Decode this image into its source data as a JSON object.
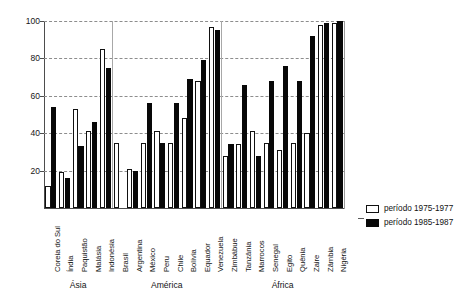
{
  "chart_data": {
    "type": "bar",
    "title": "",
    "subtitle": "",
    "xlabel": "",
    "ylabel": "",
    "ylim": [
      0,
      100
    ],
    "yticks": [
      0,
      20,
      40,
      60,
      80,
      100
    ],
    "ytick_labels": [
      "",
      "20",
      "40",
      "60",
      "80",
      "100"
    ],
    "grid": "horizontal-dashed",
    "legend_position": "right",
    "group_labels": [
      "Ásia",
      "América",
      "África"
    ],
    "groups": [
      {
        "name": "Ásia",
        "categories": [
          "Coreia do Sul",
          "Índia",
          "Paquistão",
          "Malásia",
          "Indonésia"
        ]
      },
      {
        "name": "América",
        "categories": [
          "Brasil",
          "Argentina",
          "México",
          "Peru",
          "Chile",
          "Bolívia",
          "Equador",
          "Venezuela"
        ]
      },
      {
        "name": "África",
        "categories": [
          "Zimbábue",
          "Tanzânia",
          "Marrocos",
          "Senegal",
          "Egito",
          "Quênia",
          "Zaire",
          "Zâmbia",
          "Nigéria"
        ]
      }
    ],
    "categories": [
      "Coreia do Sul",
      "Índia",
      "Paquistão",
      "Malásia",
      "Indonésia",
      "Brasil",
      "Argentina",
      "México",
      "Peru",
      "Chile",
      "Bolívia",
      "Equador",
      "Venezuela",
      "Zimbábue",
      "Tanzânia",
      "Marrocos",
      "Senegal",
      "Egito",
      "Quênia",
      "Zaire",
      "Zâmbia",
      "Nigéria"
    ],
    "series": [
      {
        "name": "período 1975-1977",
        "color": "#ffffff",
        "edge_color": "#111111",
        "values": [
          12,
          19,
          53,
          41,
          85,
          35,
          21,
          35,
          41,
          35,
          48,
          68,
          97,
          28,
          34,
          41,
          35,
          31,
          35,
          40,
          98,
          99
        ]
      },
      {
        "name": "período 1985-1987",
        "color": "#080808",
        "edge_color": "#080808",
        "values": [
          54,
          16,
          33,
          46,
          75,
          null,
          20,
          56,
          35,
          56,
          69,
          79,
          95,
          34,
          66,
          28,
          68,
          76,
          68,
          92,
          99,
          100
        ]
      }
    ]
  },
  "legend": {
    "items": [
      {
        "label": "período 1975-1977",
        "swatch": "white"
      },
      {
        "label": "período 1985-1987",
        "swatch": "black"
      }
    ]
  }
}
